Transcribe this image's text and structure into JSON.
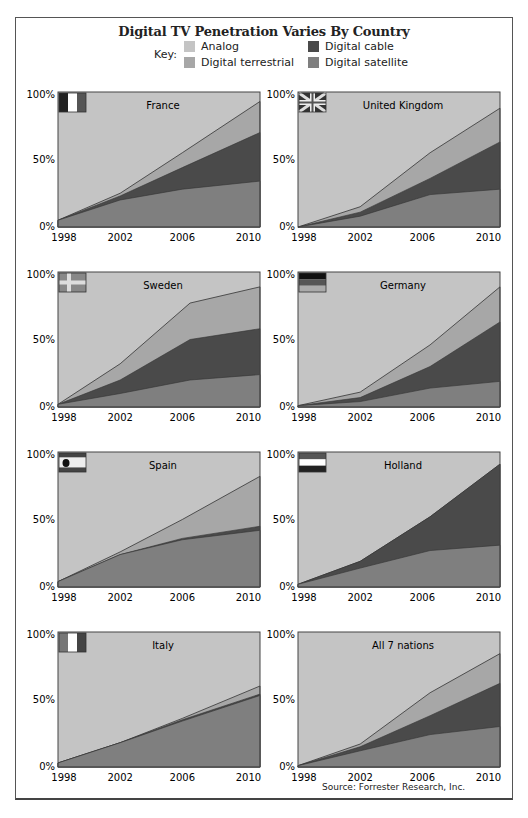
{
  "title": "Digital TV Penetration Varies By Country",
  "key": {
    "label": "Key:",
    "items": [
      {
        "name": "Analog",
        "color": "#c4c4c4"
      },
      {
        "name": "Digital terrestrial",
        "color": "#a7a7a7"
      },
      {
        "name": "Digital cable",
        "color": "#4a4a4a"
      },
      {
        "name": "Digital satellite",
        "color": "#7f7f7f"
      }
    ]
  },
  "source": "Source: Forrester Research, Inc.",
  "chart_data": [
    {
      "type": "area",
      "title": "France",
      "flag": "france",
      "x": [
        1998,
        2002,
        2006,
        2010.5
      ],
      "xticks": [
        "1998",
        "2002",
        "2006",
        "2010"
      ],
      "yticks": [
        "0%",
        "50%",
        "100%"
      ],
      "ylim": [
        0,
        100
      ],
      "series": [
        {
          "name": "Digital satellite",
          "values": [
            5,
            20,
            28,
            34
          ]
        },
        {
          "name": "Digital cable",
          "values": [
            0,
            3,
            16,
            36
          ]
        },
        {
          "name": "Digital terrestrial",
          "values": [
            0,
            2,
            11,
            23
          ]
        },
        {
          "name": "Analog",
          "values": [
            95,
            75,
            45,
            7
          ]
        }
      ]
    },
    {
      "type": "area",
      "title": "United Kingdom",
      "flag": "uk",
      "x": [
        1998,
        2002,
        2006.5,
        2010.5
      ],
      "xticks": [
        "1998",
        "2002",
        "2006",
        "2010"
      ],
      "yticks": [
        "0%",
        "50%",
        "100%"
      ],
      "ylim": [
        0,
        100
      ],
      "series": [
        {
          "name": "Digital satellite",
          "values": [
            0,
            8,
            24,
            28
          ]
        },
        {
          "name": "Digital cable",
          "values": [
            0,
            3,
            12,
            35
          ]
        },
        {
          "name": "Digital terrestrial",
          "values": [
            0,
            4,
            19,
            25
          ]
        },
        {
          "name": "Analog",
          "values": [
            100,
            85,
            45,
            12
          ]
        }
      ]
    },
    {
      "type": "area",
      "title": "Sweden",
      "flag": "sweden",
      "x": [
        1998,
        2002,
        2006.5,
        2010.5
      ],
      "xticks": [
        "1998",
        "2002",
        "2006",
        "2010"
      ],
      "yticks": [
        "0%",
        "50%",
        "100%"
      ],
      "ylim": [
        0,
        100
      ],
      "series": [
        {
          "name": "Digital satellite",
          "values": [
            2,
            10,
            20,
            24
          ]
        },
        {
          "name": "Digital cable",
          "values": [
            0,
            10,
            30,
            34
          ]
        },
        {
          "name": "Digital terrestrial",
          "values": [
            0,
            12,
            27,
            31
          ]
        },
        {
          "name": "Analog",
          "values": [
            98,
            68,
            23,
            11
          ]
        }
      ]
    },
    {
      "type": "area",
      "title": "Germany",
      "flag": "germany",
      "x": [
        1998,
        2002,
        2006.5,
        2010.5
      ],
      "xticks": [
        "1998",
        "2002",
        "2006",
        "2010"
      ],
      "yticks": [
        "0%",
        "50%",
        "100%"
      ],
      "ylim": [
        0,
        100
      ],
      "series": [
        {
          "name": "Digital satellite",
          "values": [
            1,
            4,
            14,
            19
          ]
        },
        {
          "name": "Digital cable",
          "values": [
            0,
            3,
            16,
            44
          ]
        },
        {
          "name": "Digital terrestrial",
          "values": [
            0,
            4,
            16,
            26
          ]
        },
        {
          "name": "Analog",
          "values": [
            99,
            89,
            54,
            11
          ]
        }
      ]
    },
    {
      "type": "area",
      "title": "Spain",
      "flag": "spain",
      "x": [
        1998,
        2002,
        2006,
        2010.5
      ],
      "xticks": [
        "1998",
        "2002",
        "2006",
        "2010"
      ],
      "yticks": [
        "0%",
        "50%",
        "100%"
      ],
      "ylim": [
        0,
        100
      ],
      "series": [
        {
          "name": "Digital satellite",
          "values": [
            4,
            24,
            35,
            42
          ]
        },
        {
          "name": "Digital cable",
          "values": [
            0,
            0,
            1,
            3
          ]
        },
        {
          "name": "Digital terrestrial",
          "values": [
            0,
            2,
            14,
            37
          ]
        },
        {
          "name": "Analog",
          "values": [
            96,
            74,
            50,
            18
          ]
        }
      ]
    },
    {
      "type": "area",
      "title": "Holland",
      "flag": "holland",
      "x": [
        1998,
        2002,
        2006.5,
        2010.5
      ],
      "xticks": [
        "1998",
        "2002",
        "2006",
        "2010"
      ],
      "yticks": [
        "0%",
        "50%",
        "100%"
      ],
      "ylim": [
        0,
        100
      ],
      "series": [
        {
          "name": "Digital satellite",
          "values": [
            2,
            14,
            27,
            31
          ]
        },
        {
          "name": "Digital cable",
          "values": [
            0,
            5,
            25,
            60
          ]
        },
        {
          "name": "Digital terrestrial",
          "values": [
            0,
            0,
            0,
            0
          ]
        },
        {
          "name": "Analog",
          "values": [
            98,
            81,
            48,
            9
          ]
        }
      ]
    },
    {
      "type": "area",
      "title": "Italy",
      "flag": "italy",
      "x": [
        1998,
        2002,
        2006,
        2010.5
      ],
      "xticks": [
        "1998",
        "2002",
        "2006",
        "2010"
      ],
      "yticks": [
        "0%",
        "50%",
        "100%"
      ],
      "ylim": [
        0,
        100
      ],
      "series": [
        {
          "name": "Digital satellite",
          "values": [
            3,
            18,
            34,
            53
          ]
        },
        {
          "name": "Digital cable",
          "values": [
            0,
            0,
            1,
            1
          ]
        },
        {
          "name": "Digital terrestrial",
          "values": [
            0,
            0,
            1,
            6
          ]
        },
        {
          "name": "Analog",
          "values": [
            97,
            82,
            64,
            40
          ]
        }
      ]
    },
    {
      "type": "area",
      "title": "All 7 nations",
      "flag": "none",
      "x": [
        1998,
        2002,
        2006.5,
        2010.5
      ],
      "xticks": [
        "1998",
        "2002",
        "2006",
        "2010"
      ],
      "yticks": [
        "0%",
        "50%",
        "100%"
      ],
      "ylim": [
        0,
        100
      ],
      "series": [
        {
          "name": "Digital satellite",
          "values": [
            1,
            12,
            24,
            30
          ]
        },
        {
          "name": "Digital cable",
          "values": [
            0,
            3,
            14,
            32
          ]
        },
        {
          "name": "Digital terrestrial",
          "values": [
            0,
            2,
            17,
            22
          ]
        },
        {
          "name": "Analog",
          "values": [
            99,
            83,
            45,
            16
          ]
        }
      ]
    }
  ]
}
